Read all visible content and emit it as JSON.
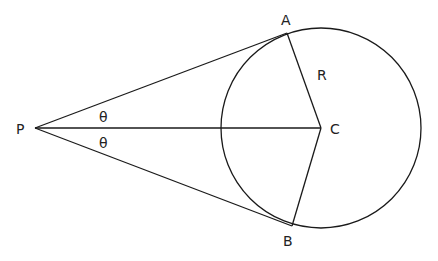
{
  "diagram": {
    "colors": {
      "stroke": "#1a1a1a",
      "text": "#222222",
      "background": "#ffffff"
    },
    "points": {
      "P": {
        "label": "P",
        "x": 35,
        "y": 128
      },
      "A": {
        "label": "A",
        "x": 287,
        "y": 33
      },
      "B": {
        "label": "B",
        "x": 292,
        "y": 226
      },
      "C": {
        "label": "C",
        "x": 321,
        "y": 128
      }
    },
    "circle": {
      "cx": 321,
      "cy": 128,
      "r": 100
    },
    "labels": {
      "P": "P",
      "A": "A",
      "B": "B",
      "C": "C",
      "radius": "R",
      "theta_upper": "θ",
      "theta_lower": "θ"
    },
    "segments": [
      "PA",
      "PB",
      "PC",
      "CA",
      "CB"
    ]
  }
}
